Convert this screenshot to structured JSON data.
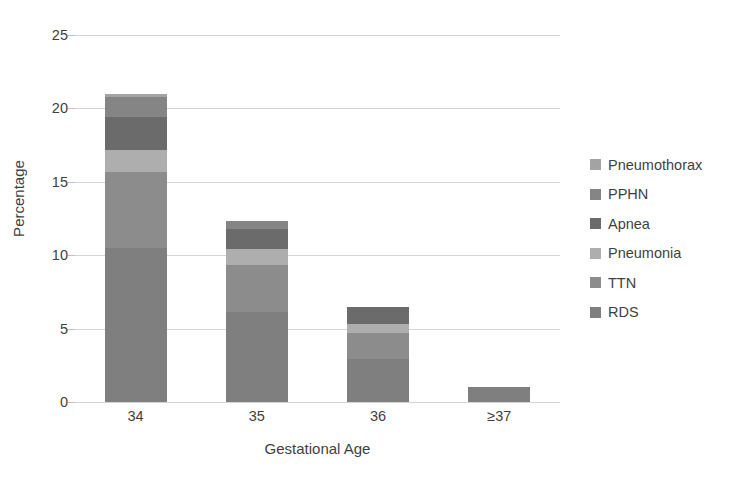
{
  "chart_data": {
    "type": "bar",
    "stacked": true,
    "title": "",
    "xlabel": "Gestational Age",
    "ylabel": "Percentage",
    "categories": [
      "34",
      "35",
      "36",
      "≥37"
    ],
    "ylim": [
      0,
      25
    ],
    "yticks": [
      0,
      5,
      10,
      15,
      20,
      25
    ],
    "ytick_labels": [
      "0",
      "5",
      "10",
      "15",
      "20",
      "25"
    ],
    "grid": "horizontal",
    "legend_position": "right",
    "series": [
      {
        "name": "RDS",
        "color": "#7f7f7f",
        "values": [
          10.5,
          6.1,
          2.9,
          1.0
        ]
      },
      {
        "name": "TTN",
        "color": "#8c8c8c",
        "values": [
          5.2,
          3.2,
          1.8,
          0.0
        ]
      },
      {
        "name": "Pneumonia",
        "color": "#aeaeae",
        "values": [
          1.5,
          1.1,
          0.6,
          0.0
        ]
      },
      {
        "name": "Apnea",
        "color": "#6b6b6b",
        "values": [
          2.2,
          1.4,
          1.2,
          0.0
        ]
      },
      {
        "name": "PPHN",
        "color": "#858585",
        "values": [
          1.4,
          0.5,
          0.0,
          0.0
        ]
      },
      {
        "name": "Pneumothorax",
        "color": "#a3a3a3",
        "values": [
          0.2,
          0.0,
          0.0,
          0.0
        ]
      }
    ],
    "totals": [
      21.0,
      12.3,
      6.5,
      1.0
    ],
    "legend_entries": [
      "Pneumothorax",
      "PPHN",
      "Apnea",
      "Pneumonia",
      "TTN",
      "RDS"
    ]
  },
  "colors": {
    "gridline": "#d4d4d4",
    "text": "#3f3f3f",
    "background": "#ffffff"
  }
}
